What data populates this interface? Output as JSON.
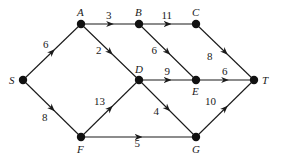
{
  "diagram": {
    "type": "directed-weighted-graph",
    "nodes": [
      {
        "id": "S",
        "label": "S",
        "x": 23,
        "y": 80
      },
      {
        "id": "A",
        "label": "A",
        "x": 81,
        "y": 24
      },
      {
        "id": "B",
        "label": "B",
        "x": 139,
        "y": 24
      },
      {
        "id": "C",
        "label": "C",
        "x": 196,
        "y": 24
      },
      {
        "id": "D",
        "label": "D",
        "x": 139,
        "y": 80
      },
      {
        "id": "E",
        "label": "E",
        "x": 196,
        "y": 80
      },
      {
        "id": "T",
        "label": "T",
        "x": 254,
        "y": 80
      },
      {
        "id": "F",
        "label": "F",
        "x": 81,
        "y": 137
      },
      {
        "id": "G",
        "label": "G",
        "x": 196,
        "y": 137
      }
    ],
    "edges": [
      {
        "from": "S",
        "to": "A",
        "weight": "6"
      },
      {
        "from": "S",
        "to": "F",
        "weight": "8"
      },
      {
        "from": "A",
        "to": "B",
        "weight": "3"
      },
      {
        "from": "A",
        "to": "D",
        "weight": "2"
      },
      {
        "from": "B",
        "to": "C",
        "weight": "11"
      },
      {
        "from": "B",
        "to": "E",
        "weight": "6"
      },
      {
        "from": "C",
        "to": "T",
        "weight": "8"
      },
      {
        "from": "D",
        "to": "E",
        "weight": "9"
      },
      {
        "from": "D",
        "to": "G",
        "weight": "4"
      },
      {
        "from": "E",
        "to": "T",
        "weight": "6"
      },
      {
        "from": "F",
        "to": "D",
        "weight": "13"
      },
      {
        "from": "F",
        "to": "G",
        "weight": "5"
      },
      {
        "from": "G",
        "to": "T",
        "weight": "10"
      }
    ]
  }
}
